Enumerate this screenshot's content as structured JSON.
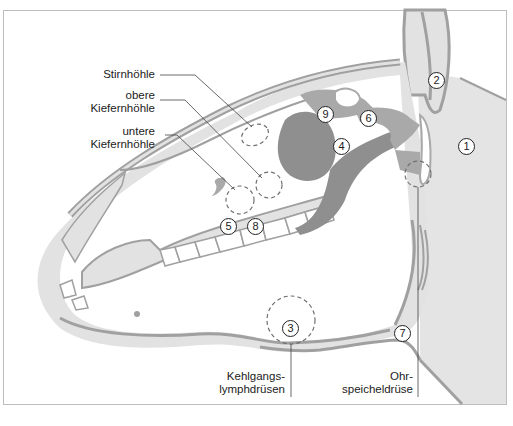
{
  "diagram": {
    "colors": {
      "tissue_light": "#e2e2e2",
      "tissue_medium": "#a9a9a9",
      "tissue_dark": "#8f8f8f",
      "line": "#333333",
      "frame": "#bdbdbd",
      "background": "#ffffff"
    },
    "labels": {
      "stirnhoehle": "Stirnhöhle",
      "obere_1": "obere",
      "obere_2": "Kiefernhöhle",
      "untere_1": "untere",
      "untere_2": "Kiefernhöhle",
      "kehl_1": "Kehlgangs-",
      "kehl_2": "lymphdrüsen",
      "ohr_1": "Ohr-",
      "ohr_2": "speicheldrüse"
    },
    "markers": [
      {
        "id": "1",
        "label": "1"
      },
      {
        "id": "2",
        "label": "2"
      },
      {
        "id": "3",
        "label": "3"
      },
      {
        "id": "4",
        "label": "4"
      },
      {
        "id": "5",
        "label": "5"
      },
      {
        "id": "6",
        "label": "6"
      },
      {
        "id": "7",
        "label": "7"
      },
      {
        "id": "8",
        "label": "8"
      },
      {
        "id": "9",
        "label": "9"
      }
    ]
  }
}
